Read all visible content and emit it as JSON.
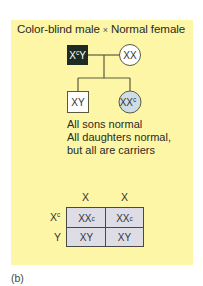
{
  "title": {
    "left": "Color-blind male",
    "operator": "×",
    "right": "Normal female"
  },
  "pedigree": {
    "father": {
      "base": "X",
      "sup": "c",
      "tail": "Y",
      "shape": "square",
      "fill": "#1f2a22",
      "affected": true
    },
    "mother": {
      "label": "XX",
      "shape": "circle",
      "fill": "#ffffff"
    },
    "son": {
      "label": "XY",
      "shape": "square",
      "fill": "#ffffff"
    },
    "daughter": {
      "base": "XX",
      "sup": "c",
      "shape": "circle",
      "fill": "#cfdee6",
      "carrier": true
    }
  },
  "notes": [
    "All sons normal",
    "All daughters normal,",
    "but all are carriers"
  ],
  "punnett": {
    "col_headers": [
      "X",
      "X"
    ],
    "row_headers": [
      {
        "base": "X",
        "sup": "c"
      },
      {
        "base": "Y",
        "sup": ""
      }
    ],
    "cells": [
      [
        {
          "base": "XX",
          "sup": "c"
        },
        {
          "base": "XX",
          "sup": "c"
        }
      ],
      [
        {
          "base": "XY",
          "sup": ""
        },
        {
          "base": "XY",
          "sup": ""
        }
      ]
    ],
    "fill": "#dedde6"
  },
  "colors": {
    "panel": "#fdf6a7",
    "line": "#5b5a3c",
    "father_fill": "#1f2a22",
    "daughter_fill": "#cfdee6"
  },
  "caption": "(b)"
}
